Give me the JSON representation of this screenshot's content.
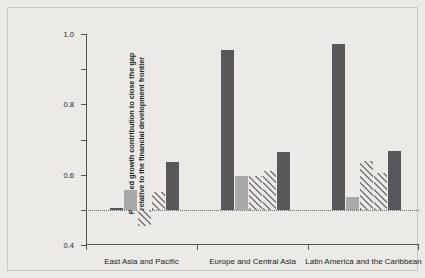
{
  "chart_data": {
    "type": "bar",
    "title": "",
    "subtitle": "",
    "xlabel": "",
    "ylabel_line1": "Predicted growth contribution to close the gap",
    "ylabel_line2": "relative to the financial development frontier",
    "ylim": [
      -0.2,
      1.0
    ],
    "yticks": [
      1.0,
      0.8,
      0.6,
      0.4,
      0.2,
      0,
      -0.2
    ],
    "ytick_labels": [
      "1.0",
      "0.8",
      "0.6",
      "0.4",
      "0.2",
      "0",
      "-0.2"
    ],
    "grid": false,
    "legend": "none",
    "zero_reference_line": true,
    "categories": [
      "East Asia and Pacific",
      "Europe and Central Asia",
      "Latin America and the Caribbean"
    ],
    "bar_styles": [
      "dark",
      "light",
      "hatch",
      "hatch",
      "dark"
    ],
    "groups": [
      {
        "category": "East Asia and Pacific",
        "bars": [
          {
            "style": "dark",
            "value": 0.01
          },
          {
            "style": "light",
            "value": 0.11
          },
          {
            "style": "hatch",
            "value": -0.09
          },
          {
            "style": "hatch",
            "value": 0.1
          },
          {
            "style": "dark",
            "value": 0.27
          }
        ]
      },
      {
        "category": "Europe and Central Asia",
        "bars": [
          {
            "style": "dark",
            "value": 0.91
          },
          {
            "style": "light",
            "value": 0.19
          },
          {
            "style": "hatch",
            "value": 0.195
          },
          {
            "style": "hatch",
            "value": 0.22
          },
          {
            "style": "dark",
            "value": 0.33
          }
        ]
      },
      {
        "category": "Latin America and the Caribbean",
        "bars": [
          {
            "style": "dark",
            "value": 0.945
          },
          {
            "style": "light",
            "value": 0.075
          },
          {
            "style": "hatch",
            "value": 0.28
          },
          {
            "style": "hatch",
            "value": 0.21
          },
          {
            "style": "dark",
            "value": 0.335
          }
        ]
      }
    ],
    "colors": {
      "dark_bar": "#58585a",
      "light_bar": "#a9a9a8",
      "hatch_stroke": "#7d7c7a",
      "axis": "#565451",
      "background": "#eceae6",
      "text": "#1d1d1b"
    }
  }
}
